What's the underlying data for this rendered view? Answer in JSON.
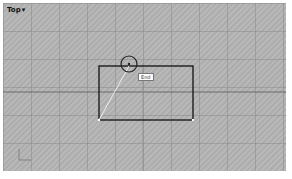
{
  "viewport": {
    "name": "Top",
    "caret": "▾"
  },
  "snap_tooltip": {
    "label": "End"
  },
  "colors": {
    "background": "#b4b4b4",
    "grid": "#8c8c8c",
    "geometry": "#111111",
    "rubberband": "#f0f0f0"
  }
}
